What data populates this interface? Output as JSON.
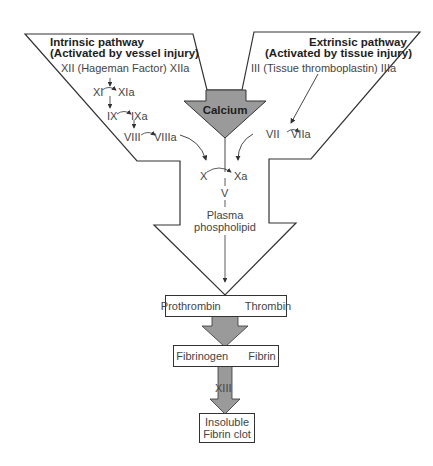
{
  "intrinsic": {
    "title": "Intrinsic pathway",
    "subtitle": "(Activated by vessel injury)",
    "factor_xii": "XII (Hageman Factor) XIIa",
    "steps": [
      {
        "from": "XI",
        "to": "XIa"
      },
      {
        "from": "IX",
        "to": "IXa"
      },
      {
        "from": "VIII",
        "to": "VIIIa"
      }
    ]
  },
  "extrinsic": {
    "title": "Extrinsic pathway",
    "subtitle": "(Activated by tissue injury)",
    "factor_iii": "III (Tissue thromboplastin) IIIa",
    "step": {
      "from": "VII",
      "to": "VIIa"
    }
  },
  "calcium": {
    "label": "Calcium",
    "fill": "#9a9a9a"
  },
  "common": {
    "x_from": "X",
    "x_to": "Xa",
    "cofactor": "V",
    "phospholipid_line1": "Plasma",
    "phospholipid_line2": "phospholipid"
  },
  "cascade": {
    "box1": {
      "from": "Prothrombin",
      "to": "Thrombin"
    },
    "box2": {
      "from": "Fibrinogen",
      "to": "Fibrin"
    },
    "factor_xiii": "XIII",
    "box3_line1": "Insoluble",
    "box3_line2": "Fibrin clot"
  },
  "colors": {
    "arrow_fill": "#9a9a9a",
    "outline": "#333333"
  }
}
